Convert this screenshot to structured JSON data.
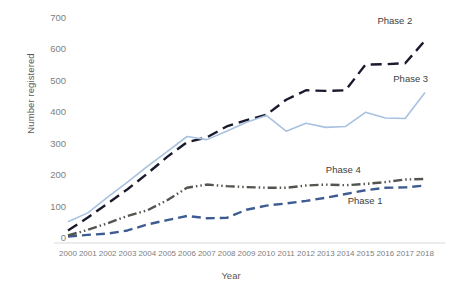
{
  "chart_data": {
    "type": "line",
    "title": "",
    "xlabel": "Year",
    "ylabel": "Number registered",
    "x": [
      2000,
      2001,
      2002,
      2003,
      2004,
      2005,
      2006,
      2007,
      2008,
      2009,
      2010,
      2011,
      2012,
      2013,
      2014,
      2015,
      2016,
      2017,
      2018
    ],
    "categories": [
      "2000",
      "2001",
      "2002",
      "2003",
      "2004",
      "2005",
      "2006",
      "2007",
      "2008",
      "2009",
      "2010",
      "2011",
      "2012",
      "2013",
      "2014",
      "2015",
      "2016",
      "2017",
      "2018"
    ],
    "xlim": [
      1999.4,
      2018.6
    ],
    "ylim": [
      0,
      700
    ],
    "yticks": [
      0,
      100,
      200,
      300,
      400,
      500,
      600,
      700
    ],
    "grid": false,
    "legend_position": "inline-annotations",
    "series": [
      {
        "name": "Phase 1",
        "color": "#3f5c92",
        "style": "dashed",
        "label_x": 2014.1,
        "label_y": 118,
        "values": [
          5,
          10,
          14,
          24,
          43,
          57,
          70,
          63,
          64,
          90,
          103,
          110,
          118,
          128,
          140,
          152,
          160,
          161,
          167
        ]
      },
      {
        "name": "Phase 2",
        "color": "#1a1a2e",
        "style": "dash-long",
        "label_x": 2015.6,
        "label_y": 690,
        "values": [
          24,
          65,
          110,
          155,
          205,
          258,
          305,
          320,
          355,
          375,
          392,
          440,
          470,
          468,
          470,
          552,
          553,
          556,
          628
        ]
      },
      {
        "name": "Phase 3",
        "color": "#a8c1e0",
        "style": "solid",
        "label_x": 2016.4,
        "label_y": 505,
        "values": [
          52,
          80,
          130,
          178,
          228,
          275,
          323,
          313,
          340,
          368,
          390,
          340,
          365,
          352,
          355,
          400,
          382,
          380,
          463
        ]
      },
      {
        "name": "Phase 4",
        "color": "#51564f",
        "style": "dash-dot-dot",
        "label_x": 2013.0,
        "label_y": 215,
        "values": [
          8,
          26,
          47,
          70,
          88,
          120,
          160,
          170,
          165,
          162,
          160,
          160,
          167,
          170,
          168,
          172,
          178,
          186,
          188
        ]
      }
    ]
  },
  "axis": {
    "ylabel": "Number registered",
    "xlabel": "Year",
    "ytick_labels": [
      "700",
      "600",
      "500",
      "400",
      "300",
      "200",
      "100",
      "0"
    ],
    "xtick_labels": [
      "2000",
      "2001",
      "2002",
      "2003",
      "2004",
      "2005",
      "2006",
      "2007",
      "2008",
      "2009",
      "2010",
      "2011",
      "2012",
      "2013",
      "2014",
      "2015",
      "2016",
      "2017",
      "2018"
    ]
  },
  "annotations": {
    "phase1": "Phase 1",
    "phase2": "Phase 2",
    "phase3": "Phase 3",
    "phase4": "Phase 4"
  }
}
